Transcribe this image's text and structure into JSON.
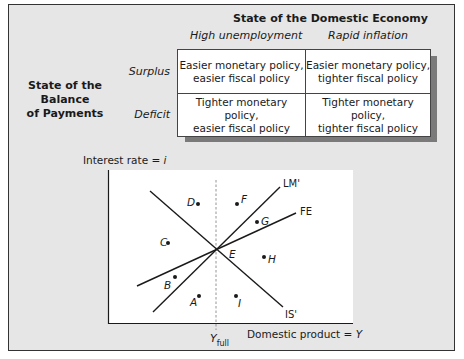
{
  "table": {
    "column_group_title": "State of the Domestic Economy",
    "columns": [
      "High unemployment",
      "Rapid inflation"
    ],
    "row_group_title_line1": "State of the Balance",
    "row_group_title_line2": "of Payments",
    "rows": [
      {
        "label": "Surplus",
        "cells": [
          {
            "line1": "Easier monetary policy,",
            "line2": "easier fiscal policy"
          },
          {
            "line1": "Easier monetary policy,",
            "line2": "tighter fiscal policy"
          }
        ]
      },
      {
        "label": "Deficit",
        "cells": [
          {
            "line1": "Tighter monetary policy,",
            "line2": "easier fiscal policy"
          },
          {
            "line1": "Tighter monetary policy,",
            "line2": "tighter fiscal policy"
          }
        ]
      }
    ]
  },
  "graph": {
    "y_axis_label": "Interest rate = ",
    "y_axis_var": "i",
    "x_axis_label": "Domestic product = ",
    "x_axis_var": "Y",
    "y_full_label": "Y",
    "y_full_sub": "full",
    "curves": [
      {
        "name": "LM'",
        "label": "LM'"
      },
      {
        "name": "FE",
        "label": "FE"
      },
      {
        "name": "IS'",
        "label": "IS'"
      }
    ],
    "intersection_label": "E",
    "points": [
      "A",
      "B",
      "C",
      "D",
      "F",
      "G",
      "H",
      "I"
    ]
  },
  "colors": {
    "background": "#e6e6e6",
    "panel": "#ffffff",
    "line": "#1a1a1a",
    "shadow": "#7a7a7a"
  }
}
